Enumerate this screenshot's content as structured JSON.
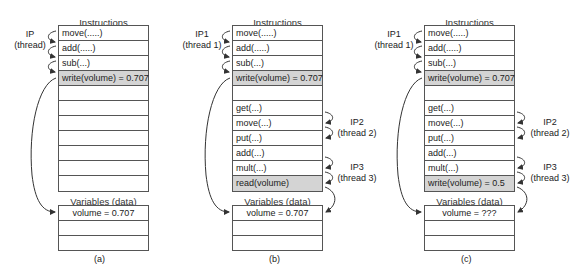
{
  "panels": [
    {
      "caption": "(a)",
      "instructions_title": "Instructions",
      "instructions": [
        {
          "text": "move(.....)",
          "highlight": false
        },
        {
          "text": "add(.....)",
          "highlight": false
        },
        {
          "text": "sub(...)",
          "highlight": false
        },
        {
          "text": "write(volume) = 0.707",
          "highlight": true
        },
        {
          "text": "",
          "highlight": false
        },
        {
          "text": "",
          "highlight": false
        },
        {
          "text": "",
          "highlight": false
        },
        {
          "text": "",
          "highlight": false
        },
        {
          "text": "",
          "highlight": false
        },
        {
          "text": "",
          "highlight": false
        },
        {
          "text": "",
          "highlight": false
        }
      ],
      "variables_title": "Variables (data)",
      "variables": [
        "volume = 0.707",
        "",
        ""
      ],
      "pointers": [
        {
          "name": "IP",
          "thread": "(thread)"
        }
      ]
    },
    {
      "caption": "(b)",
      "instructions_title": "Instructions",
      "instructions": [
        {
          "text": "move(.....)",
          "highlight": false
        },
        {
          "text": "add(.....)",
          "highlight": false
        },
        {
          "text": "sub(...)",
          "highlight": false
        },
        {
          "text": "write(volume) = 0.707",
          "highlight": true
        },
        {
          "text": "",
          "highlight": false
        },
        {
          "text": "get(...)",
          "highlight": false
        },
        {
          "text": "move(...)",
          "highlight": false
        },
        {
          "text": "put(...)",
          "highlight": false
        },
        {
          "text": "add(...)",
          "highlight": false
        },
        {
          "text": "mult(...)",
          "highlight": false
        },
        {
          "text": "read(volume)",
          "highlight": true
        }
      ],
      "variables_title": "Variables (data)",
      "variables": [
        "volume = 0.707",
        "",
        ""
      ],
      "pointers": [
        {
          "name": "IP1",
          "thread": "(thread 1)"
        },
        {
          "name": "IP2",
          "thread": "(thread 2)"
        },
        {
          "name": "IP3",
          "thread": "(thread 3)"
        }
      ]
    },
    {
      "caption": "(c)",
      "instructions_title": "Instructions",
      "instructions": [
        {
          "text": "move(.....)",
          "highlight": false
        },
        {
          "text": "add(.....)",
          "highlight": false
        },
        {
          "text": "sub(...)",
          "highlight": false
        },
        {
          "text": "write(volume) = 0.707",
          "highlight": true
        },
        {
          "text": "",
          "highlight": false
        },
        {
          "text": "get(...)",
          "highlight": false
        },
        {
          "text": "move(...)",
          "highlight": false
        },
        {
          "text": "put(...)",
          "highlight": false
        },
        {
          "text": "add(...)",
          "highlight": false
        },
        {
          "text": "mult(...)",
          "highlight": false
        },
        {
          "text": "write(volume) = 0.5",
          "highlight": true
        }
      ],
      "variables_title": "Variables (data)",
      "variables": [
        "volume = ???",
        "",
        ""
      ],
      "pointers": [
        {
          "name": "IP1",
          "thread": "(thread 1)"
        },
        {
          "name": "IP2",
          "thread": "(thread 2)"
        },
        {
          "name": "IP3",
          "thread": "(thread 3)"
        }
      ]
    }
  ],
  "colors": {
    "highlight_row": "#d4d4d4",
    "border": "#555555",
    "arrow": "#333333"
  }
}
